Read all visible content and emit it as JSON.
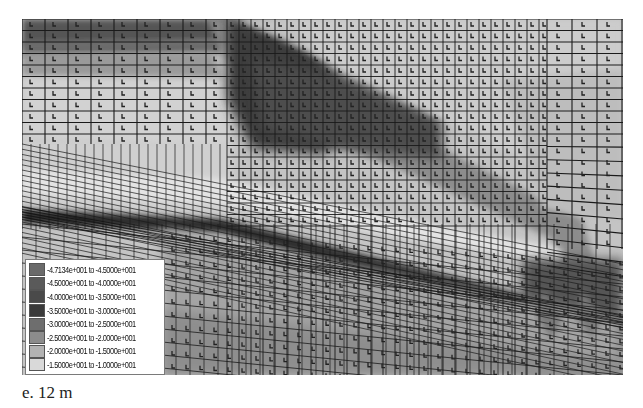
{
  "figure": {
    "type": "finite-element-contour-plot",
    "caption": "e. 12 m"
  },
  "legend": {
    "entries": [
      {
        "from": "-4.7134e+001",
        "to": "-4.5000e+001",
        "label": "-4.7134e+001 to -4.5000e+001",
        "color": "#6a6a6a"
      },
      {
        "from": "-4.5000e+001",
        "to": "-4.0000e+001",
        "label": "-4.5000e+001 to -4.0000e+001",
        "color": "#5a5a5a"
      },
      {
        "from": "-4.0000e+001",
        "to": "-3.5000e+001",
        "label": "-4.0000e+001 to -3.5000e+001",
        "color": "#4a4a4a"
      },
      {
        "from": "-3.5000e+001",
        "to": "-3.0000e+001",
        "label": "-3.5000e+001 to -3.0000e+001",
        "color": "#3a3a3a"
      },
      {
        "from": "-3.0000e+001",
        "to": "-2.5000e+001",
        "label": "-3.0000e+001 to -2.5000e+001",
        "color": "#6e6e6e"
      },
      {
        "from": "-2.5000e+001",
        "to": "-2.0000e+001",
        "label": "-2.5000e+001 to -2.0000e+001",
        "color": "#8c8c8c"
      },
      {
        "from": "-2.0000e+001",
        "to": "-1.5000e+001",
        "label": "-2.0000e+001 to -1.5000e+001",
        "color": "#b2b2b2"
      },
      {
        "from": "-1.5000e+001",
        "to": "-1.0000e+001",
        "label": "-1.5000e+001 to -1.0000e+001",
        "color": "#d9d9d9"
      }
    ]
  },
  "colors": {
    "background": "#ffffff",
    "mesh_line": "#1a1a1a",
    "light_region": "#d4d4d4",
    "mid_region": "#a8a8a8",
    "dark_region": "#3c3c3c",
    "band": "#8a8a8a"
  }
}
